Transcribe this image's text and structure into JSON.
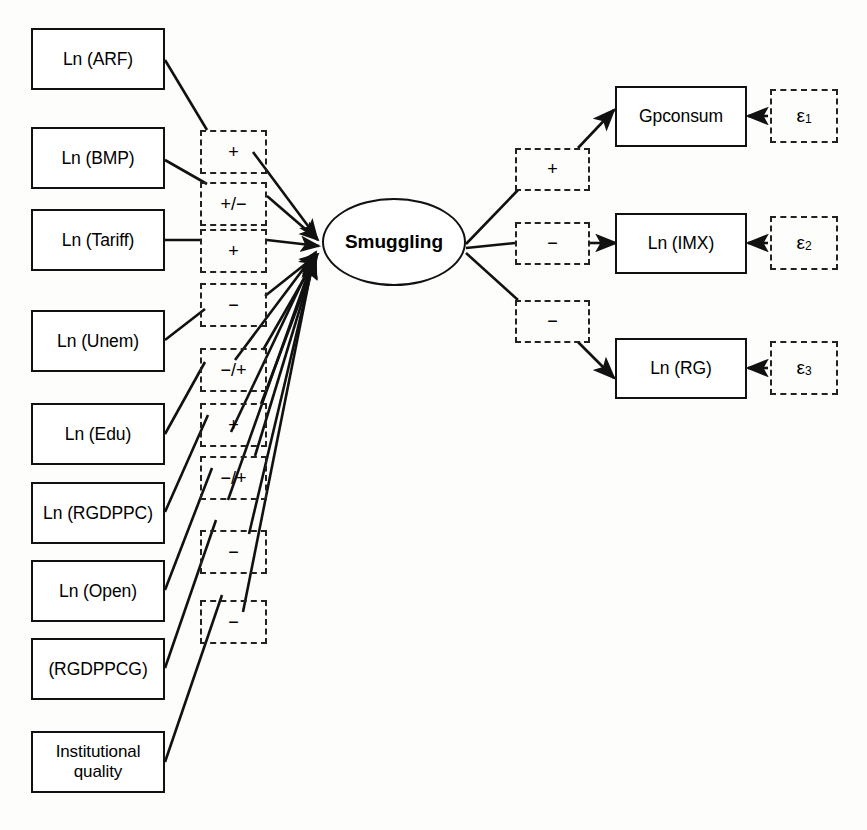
{
  "diagram": {
    "latent": {
      "label": "Smuggling",
      "shape": "ellipse"
    },
    "predictors": [
      {
        "id": "arf",
        "label": "Ln (ARF)",
        "sign": "+"
      },
      {
        "id": "bmp",
        "label": "Ln (BMP)",
        "sign": "+/−"
      },
      {
        "id": "tariff",
        "label": "Ln (Tariff)",
        "sign": "+"
      },
      {
        "id": "unem",
        "label": "Ln (Unem)",
        "sign": "−"
      },
      {
        "id": "edu",
        "label": "Ln (Edu)",
        "sign": "−/+"
      },
      {
        "id": "rgdppc",
        "label": "Ln (RGDPPC)",
        "sign": "+"
      },
      {
        "id": "open",
        "label": "Ln (Open)",
        "sign": "−/+"
      },
      {
        "id": "rgdppcg",
        "label": "(RGDPPCG)",
        "sign": "−"
      },
      {
        "id": "instqual",
        "label": "Institutional\nquality",
        "sign": "−"
      }
    ],
    "predictor_signs_order": [
      "+",
      "+/−",
      "+",
      "−",
      "−/+",
      "+",
      "−/+",
      "−",
      "−"
    ],
    "outcomes": [
      {
        "id": "gpconsum",
        "label": "Gpconsum",
        "sign": "+",
        "error": "ε",
        "error_sub": "1"
      },
      {
        "id": "imx",
        "label": "Ln (IMX)",
        "sign": "−",
        "error": "ε",
        "error_sub": "2"
      },
      {
        "id": "rg",
        "label": "Ln (RG)",
        "sign": "−",
        "error": "ε",
        "error_sub": "3"
      }
    ],
    "colors": {
      "stroke": "#111111",
      "dashed_stroke": "#222222",
      "background": "#fdfdfb",
      "text": "#000000"
    }
  }
}
